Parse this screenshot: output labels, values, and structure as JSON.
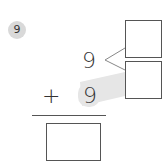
{
  "problem": {
    "number": "9",
    "top_addend": "9",
    "operator": "+",
    "bottom_addend": "9",
    "decomposition_boxes": [
      "",
      ""
    ],
    "answer_box": ""
  },
  "colors": {
    "badge": "#d9d9d9",
    "highlight": "#e6e6e6",
    "ink": "#333333"
  }
}
